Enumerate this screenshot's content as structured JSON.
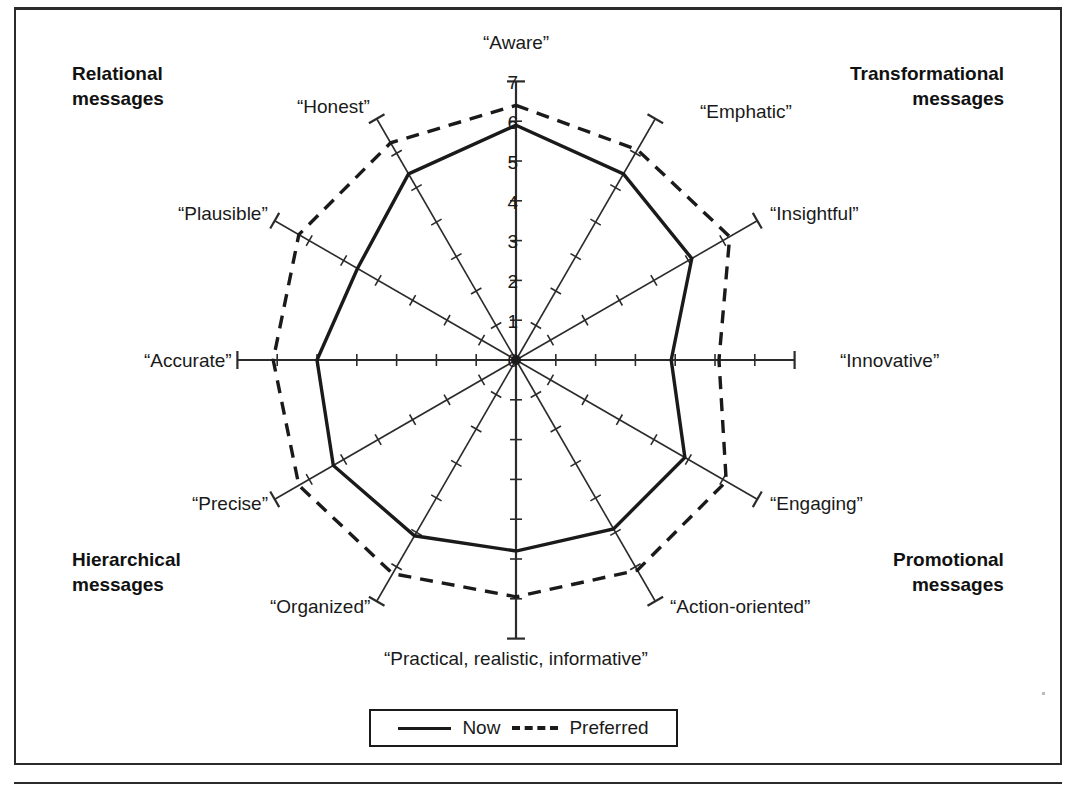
{
  "figure": {
    "center": {
      "x": 516,
      "y": 360
    },
    "unit_px": 39.8,
    "max_value": 7
  },
  "quadrants": [
    {
      "name": "relational",
      "line1": "Relational",
      "line2": "messages",
      "x": 72,
      "y": 62,
      "align": "left"
    },
    {
      "name": "transformational",
      "line1": "Transformational",
      "line2": "messages",
      "x": 1004,
      "y": 62,
      "align": "right"
    },
    {
      "name": "hierarchical",
      "line1": "Hierarchical",
      "line2": "messages",
      "x": 72,
      "y": 548,
      "align": "left"
    },
    {
      "name": "promotional",
      "line1": "Promotional",
      "line2": "messages",
      "x": 1004,
      "y": 548,
      "align": "right"
    }
  ],
  "axis_ticks": {
    "values": [
      7,
      6,
      5,
      4,
      3,
      2,
      1,
      0
    ],
    "label_x": 494,
    "label_ys": [
      72,
      112,
      152,
      192,
      231,
      271,
      311,
      350
    ]
  },
  "legend": {
    "now_label": "Now",
    "preferred_label": "Preferred"
  },
  "style": {
    "now_color": "#1a1a1a",
    "preferred_color": "#1a1a1a",
    "axis_color": "#2b2b2b",
    "now_width": 3.4,
    "preferred_width": 3.4,
    "preferred_dash": "13,9"
  },
  "chart_data": {
    "type": "radar",
    "title": "",
    "xlabel": "",
    "ylabel": "",
    "rlim": [
      0,
      7
    ],
    "grid": false,
    "legend_position": "bottom",
    "categories": [
      "“Aware”",
      "“Emphatic”",
      "“Insightful”",
      "“Innovative”",
      "“Engaging”",
      "“Action-oriented”",
      "“Practical, realistic, informative”",
      "“Organized”",
      "“Precise”",
      "“Accurate”",
      "“Plausible”",
      "“Honest”"
    ],
    "angles_deg": [
      90,
      60,
      30,
      0,
      -30,
      -60,
      -90,
      -120,
      -150,
      180,
      150,
      120
    ],
    "label_positions": [
      {
        "x": 516,
        "y": 44,
        "anchor": "middle"
      },
      {
        "x": 700,
        "y": 113,
        "anchor": "start"
      },
      {
        "x": 770,
        "y": 215,
        "anchor": "start"
      },
      {
        "x": 840,
        "y": 362,
        "anchor": "start"
      },
      {
        "x": 770,
        "y": 505,
        "anchor": "start"
      },
      {
        "x": 670,
        "y": 608,
        "anchor": "start"
      },
      {
        "x": 516,
        "y": 660,
        "anchor": "middle"
      },
      {
        "x": 370,
        "y": 608,
        "anchor": "end"
      },
      {
        "x": 268,
        "y": 505,
        "anchor": "end"
      },
      {
        "x": 232,
        "y": 362,
        "anchor": "end"
      },
      {
        "x": 268,
        "y": 215,
        "anchor": "end"
      },
      {
        "x": 370,
        "y": 108,
        "anchor": "end"
      }
    ],
    "series": [
      {
        "name": "Now",
        "style": "solid",
        "values": [
          5.9,
          5.4,
          5.1,
          3.9,
          4.9,
          4.9,
          4.8,
          5.1,
          5.3,
          5.0,
          4.6,
          5.4
        ]
      },
      {
        "name": "Preferred",
        "style": "dashed",
        "values": [
          6.4,
          6.1,
          6.2,
          5.1,
          6.1,
          6.1,
          5.95,
          6.2,
          6.3,
          6.1,
          6.3,
          6.3
        ]
      }
    ]
  }
}
